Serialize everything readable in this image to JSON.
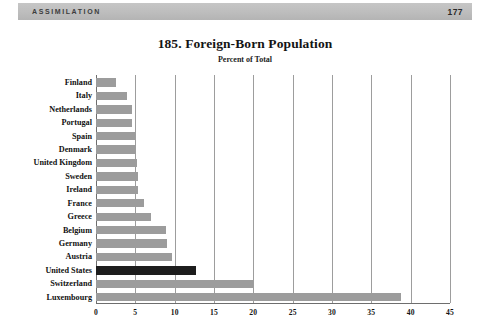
{
  "header": {
    "section": "ASSIMILATION",
    "page_number": "177"
  },
  "chart_data": {
    "type": "bar",
    "orientation": "horizontal",
    "title": "185. Foreign-Born Population",
    "subtitle": "Percent of Total",
    "xlabel": "",
    "ylabel": "",
    "xlim": [
      0,
      45
    ],
    "xticks": [
      "0",
      "5",
      "10",
      "15",
      "20",
      "25",
      "30",
      "35",
      "40",
      "45"
    ],
    "xtick_values": [
      0,
      5,
      10,
      15,
      20,
      25,
      30,
      35,
      40,
      45
    ],
    "grid": "vertical",
    "legend": "none",
    "categories": [
      "Finland",
      "Italy",
      "Netherlands",
      "Portugal",
      "Spain",
      "Denmark",
      "United Kingdom",
      "Sweden",
      "Ireland",
      "France",
      "Greece",
      "Belgium",
      "Germany",
      "Austria",
      "United States",
      "Switzerland",
      "Luxembourg"
    ],
    "values": [
      2.6,
      4.0,
      4.6,
      4.6,
      5.0,
      5.1,
      5.2,
      5.3,
      5.4,
      6.1,
      7.0,
      8.9,
      9.0,
      9.6,
      12.7,
      20.0,
      38.8
    ],
    "highlight_category": "United States",
    "colors": {
      "bar": "#9c9c9c",
      "highlight_bar": "#1d1d1d",
      "gridline": "#9d9d9d",
      "axis": "#6e6e6e",
      "header_band": "#bdbdbd",
      "text": "#111111"
    }
  }
}
